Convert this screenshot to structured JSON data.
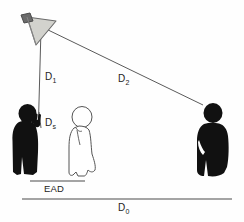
{
  "figure": {
    "background_color": "#fefefe",
    "line_color": "#4a4a4a",
    "silhouette_color": "#111111",
    "horn_body_color": "#d0d0cc",
    "horn_driver_color": "#6e6e6e",
    "outline_color": "#555555"
  },
  "labels": {
    "d1": "D",
    "d1_sub": "1",
    "d2": "D",
    "d2_sub": "2",
    "ds": "D",
    "ds_sub": "s",
    "ead": "EAD",
    "d0": "D",
    "d0_sub": "0"
  },
  "elements": {
    "loudspeaker": "loudspeaker-horn",
    "person_left": "person-with-microphone",
    "person_middle": "person-outline-kneeling",
    "person_right": "person-listener",
    "line_d1": "distance-line-d1",
    "line_d2": "distance-line-d2",
    "line_ds": "distance-line-ds",
    "line_ead": "baseline-ead",
    "line_d0": "baseline-d0"
  }
}
